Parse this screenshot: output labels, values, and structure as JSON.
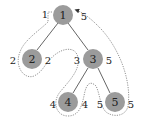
{
  "diagram": {
    "type": "tree-euler-tour",
    "colors": {
      "node_fill": "#9b9b9b",
      "edge": "#555555",
      "path": "#777777",
      "text": "#222222"
    },
    "nodes": [
      {
        "id": "1",
        "label": "1",
        "x": 63,
        "y": 15
      },
      {
        "id": "2",
        "label": "2",
        "x": 32,
        "y": 59
      },
      {
        "id": "3",
        "label": "3",
        "x": 93,
        "y": 59
      },
      {
        "id": "4",
        "label": "4",
        "x": 68,
        "y": 102
      },
      {
        "id": "5",
        "label": "5",
        "x": 115,
        "y": 102
      }
    ],
    "edges": [
      {
        "from": "1",
        "to": "2"
      },
      {
        "from": "1",
        "to": "3"
      },
      {
        "from": "3",
        "to": "4"
      },
      {
        "from": "3",
        "to": "5"
      }
    ],
    "annotations": [
      {
        "node": "1",
        "side": "left",
        "text": "1"
      },
      {
        "node": "1",
        "side": "right",
        "text": "5"
      },
      {
        "node": "2",
        "side": "left",
        "text": "2"
      },
      {
        "node": "2",
        "side": "right",
        "text": "2"
      },
      {
        "node": "3",
        "side": "left",
        "text": "3"
      },
      {
        "node": "3",
        "side": "right",
        "text": "5"
      },
      {
        "node": "4",
        "side": "left",
        "text": "4"
      },
      {
        "node": "4",
        "side": "right",
        "text": "4"
      },
      {
        "node": "5",
        "side": "left",
        "text": "5"
      },
      {
        "node": "5",
        "side": "right",
        "text": "5"
      }
    ]
  }
}
